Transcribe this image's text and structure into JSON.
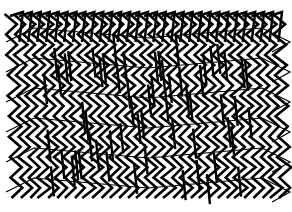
{
  "canvas": {
    "width": 292,
    "height": 212,
    "background": "#ffffff",
    "stroke": "#000000"
  },
  "artwork": {
    "description": "Dense mesh of black zigzag strokes forming a woven lattice",
    "region": {
      "x0": 14,
      "y0": 14,
      "x1": 282,
      "y1": 198
    },
    "columns": 30,
    "zigzag_rows": 9,
    "stroke_width": 2.6,
    "lean": 7
  }
}
